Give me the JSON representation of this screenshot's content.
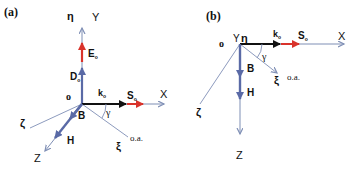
{
  "panels": {
    "a": {
      "label": "(a)",
      "axes": {
        "x": "X",
        "y": "Y",
        "z": "Z",
        "eta": "η",
        "zeta": "ζ",
        "xi": "ξ",
        "origin": "o",
        "optic_axis": "o.a."
      },
      "vectors": {
        "E": "E",
        "E_sub": "o",
        "D": "D",
        "D_sub": "o",
        "k": "k",
        "k_sub": "o",
        "S": "S",
        "S_sub": "o",
        "B": "B",
        "H": "H"
      },
      "angle": "γ"
    },
    "b": {
      "label": "(b)",
      "axes": {
        "x": "X",
        "y": "Y",
        "z": "Z",
        "eta": "η",
        "zeta": "ζ",
        "xi": "ξ",
        "origin": "o",
        "optic_axis": "o.a."
      },
      "vectors": {
        "k": "k",
        "k_sub": "o",
        "S": "S",
        "S_sub": "o",
        "B": "B",
        "H": "H"
      },
      "angle": "γ"
    }
  },
  "colors": {
    "axis": "#7f8fb5",
    "vector_blue": "#5a6aa6",
    "vector_red": "#d9332b",
    "vector_black": "#111111",
    "text": "#111111"
  }
}
